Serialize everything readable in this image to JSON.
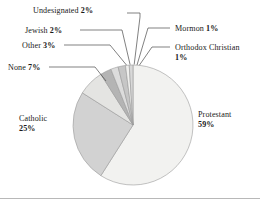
{
  "chart_data": {
    "type": "pie",
    "title": "",
    "xlabel": "",
    "ylabel": "",
    "legend_position": "none",
    "grid": false,
    "units": "percent",
    "total": 100,
    "start_angle_deg": 0,
    "direction": "clockwise",
    "categories": [
      "Protestant",
      "Catholic",
      "None",
      "Other",
      "Jewish",
      "Undesignated",
      "Mormon",
      "Orthodox Christian"
    ],
    "values": [
      59,
      25,
      7,
      3,
      2,
      2,
      1,
      1
    ],
    "slices": [
      {
        "label": "Protestant",
        "value": 59,
        "value_text": "59%",
        "color": "#f2f2f0"
      },
      {
        "label": "Catholic",
        "value": 25,
        "value_text": "25%",
        "color": "#d2d2d2"
      },
      {
        "label": "None",
        "value": 7,
        "value_text": "7%",
        "color": "#e4e4e2"
      },
      {
        "label": "Other",
        "value": 3,
        "value_text": "3%",
        "color": "#b4b4b4"
      },
      {
        "label": "Jewish",
        "value": 2,
        "value_text": "2%",
        "color": "#dcdcdc"
      },
      {
        "label": "Undesignated",
        "value": 2,
        "value_text": "2%",
        "color": "#c6c6c6"
      },
      {
        "label": "Mormon",
        "value": 1,
        "value_text": "1%",
        "color": "#efefed"
      },
      {
        "label": "Orthodox Christian",
        "value": 1,
        "value_text": "1%",
        "color": "#d8d8d8"
      }
    ],
    "geometry": {
      "center_x": 133,
      "center_y": 125,
      "radius": 60
    },
    "style": {
      "slice_outline_color": "#9a9a9a",
      "leader_line_color": "#4a4a4a",
      "frame_color": "#b8b8b8",
      "background": "#ffffff"
    }
  },
  "labels": {
    "protestant": {
      "name": "Protestant",
      "pct": "59%"
    },
    "catholic": {
      "name": "Catholic",
      "pct": "25%"
    },
    "none": {
      "name": "None",
      "pct": "7%"
    },
    "other": {
      "name": "Other",
      "pct": "3%"
    },
    "jewish": {
      "name": "Jewish",
      "pct": "2%"
    },
    "undesignated": {
      "name": "Undesignated",
      "pct": "2%"
    },
    "mormon": {
      "name": "Mormon",
      "pct": "1%"
    },
    "orthodox": {
      "name": "Orthodox Christian",
      "pct": "1%"
    }
  },
  "leader_lines": [
    {
      "name": "leader-undesignated",
      "points": "127,13 140,13 140,17 134.2,64.5"
    },
    {
      "name": "leader-jewish",
      "points": "80,30 122,30 130.1,64.6"
    },
    {
      "name": "leader-other",
      "points": "64,45 110,45 126.6,65.2"
    },
    {
      "name": "leader-none",
      "points": "49,67 95,67 106,81"
    },
    {
      "name": "leader-mormon",
      "points": "170,28 148,28 137.0,65.0"
    },
    {
      "name": "leader-orthodox",
      "points": "170,47 152,47 139.3,65.3"
    }
  ]
}
